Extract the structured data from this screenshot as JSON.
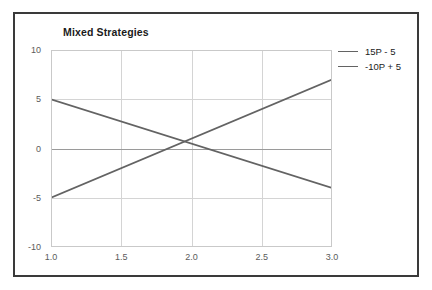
{
  "chart_data": {
    "type": "line",
    "title": "Mixed Strategies",
    "xlabel": "",
    "ylabel": "",
    "xlim": [
      1.0,
      3.0
    ],
    "ylim": [
      -10,
      10
    ],
    "grid": true,
    "legend_position": "right-outside",
    "xticks": [
      "1.0",
      "1.5",
      "2.0",
      "2.5",
      "3.0"
    ],
    "xtick_values": [
      1.0,
      1.5,
      2.0,
      2.5,
      3.0
    ],
    "yticks": [
      "10",
      "5",
      "0",
      "-5",
      "-10"
    ],
    "ytick_values": [
      10,
      5,
      0,
      -5,
      -10
    ],
    "x": [
      1.0,
      3.0
    ],
    "series": [
      {
        "name": "15P - 5",
        "color": "#636363",
        "values": [
          -5,
          7
        ]
      },
      {
        "name": "-10P + 5",
        "color": "#636363",
        "values": [
          5,
          -4
        ]
      }
    ],
    "annotations": []
  },
  "legend": {
    "entries": [
      {
        "label": "15P - 5"
      },
      {
        "label": "-10P + 5"
      }
    ]
  },
  "colors": {
    "line": "#636363",
    "grid": "#d4d4d4",
    "axis": "#9a9a9a",
    "frame_border": "#3a3a3a",
    "tick_text": "#5b5b5b",
    "title_text": "#1b1b1b",
    "background": "#ffffff"
  }
}
